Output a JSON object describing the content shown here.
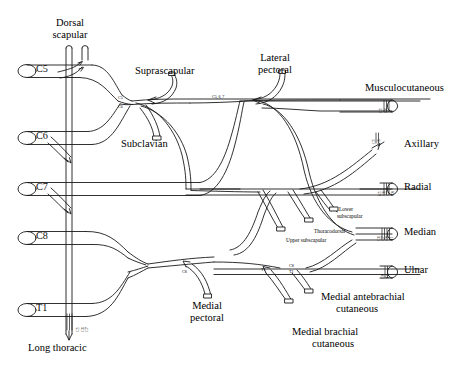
{
  "figure": {
    "stroke_color": "#1a1a1a",
    "background": "#ffffff"
  },
  "roots": [
    {
      "id": "c5",
      "label": "C5"
    },
    {
      "id": "c6",
      "label": "C6"
    },
    {
      "id": "c7",
      "label": "C7"
    },
    {
      "id": "c8",
      "label": "C8"
    },
    {
      "id": "t1",
      "label": "T1"
    }
  ],
  "branches": {
    "dorsal_scapular": "Dorsal\nscapular",
    "dorsal_scapular_l1": "Dorsal",
    "dorsal_scapular_l2": "scapular",
    "suprascapular": "Suprascapular",
    "subclavian": "Subclavian",
    "lateral_pectoral_l1": "Lateral",
    "lateral_pectoral_l2": "pectoral",
    "long_thoracic": "Long thoracic",
    "medial_pectoral_l1": "Medial",
    "medial_pectoral_l2": "pectoral",
    "upper_subscapular": "Upper subscapular",
    "thoracodorsal": "Thoracodorsal",
    "lower_subscapular_l1": "Lower",
    "lower_subscapular_l2": "subscapular",
    "medial_antebrachial_l1": "Medial antebrachial",
    "medial_antebrachial_l2": "cutaneous",
    "medial_brachial_l1": "Medial brachial",
    "medial_brachial_l2": "cutaneous"
  },
  "terminals": [
    {
      "id": "musculocutaneous",
      "label": "Musculocutaneous",
      "roots": [
        "C5",
        "C6"
      ]
    },
    {
      "id": "axillary",
      "label": "Axillary",
      "roots": [
        "C5",
        "C6"
      ]
    },
    {
      "id": "radial",
      "label": "Radial",
      "roots": [
        "C5",
        "C6",
        "C7",
        "C8"
      ]
    },
    {
      "id": "median",
      "label": "Median",
      "roots": [
        "C6",
        "C7",
        "C8",
        "T1"
      ]
    },
    {
      "id": "ulnar",
      "label": "Ulnar",
      "roots": [
        "C8",
        "T1"
      ]
    }
  ],
  "root_annotations": {
    "upper_trunk_c5": "C5",
    "upper_trunk_c6": "C6",
    "lateral_cord": "C5, 6, 7",
    "medial_pectoral": "C8",
    "medial_brachial_t1": "T1",
    "medial_antebrachial": "C8",
    "medial_antebrachial_2": "T1",
    "long_thoracic_stack": [
      "C5",
      "C6",
      "C7"
    ]
  }
}
